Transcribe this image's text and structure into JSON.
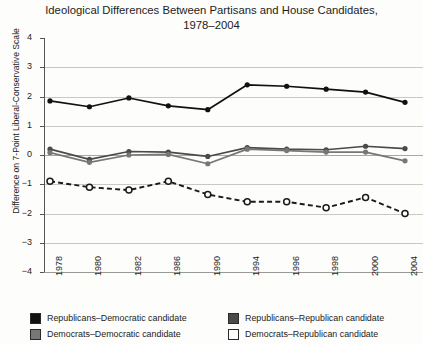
{
  "chart_data": {
    "type": "line",
    "title": "Ideological Differences Between Partisans and House Candidates, 1978–2004",
    "title_line1": "Ideological Differences Between Partisans and House Candidates,",
    "title_line2": "1978–2004",
    "xlabel": "",
    "ylabel": "Difference on 7-Point Liberal-Conservative Scale",
    "categories": [
      "1978",
      "1980",
      "1982",
      "1986",
      "1990",
      "1994",
      "1996",
      "1998",
      "2000",
      "2004"
    ],
    "ylim": [
      -4,
      4
    ],
    "yticks": [
      4,
      3,
      2,
      1,
      0,
      -1,
      -2,
      -3,
      -4
    ],
    "ytick_labels": [
      "4",
      "3",
      "2",
      "1",
      "0",
      "−1",
      "−2",
      "−3",
      "−4"
    ],
    "grid": true,
    "legend_position": "bottom",
    "series": [
      {
        "name": "Republicans–Democratic candidate",
        "color": "#111111",
        "marker": "filled-circle",
        "dash": "solid",
        "values": [
          1.85,
          1.65,
          1.95,
          1.68,
          1.55,
          2.4,
          2.35,
          2.25,
          2.15,
          1.8
        ]
      },
      {
        "name": "Republicans–Republican candidate",
        "color": "#4a4a4a",
        "marker": "filled-circle",
        "dash": "solid",
        "values": [
          0.2,
          -0.15,
          0.12,
          0.1,
          -0.05,
          0.25,
          0.2,
          0.18,
          0.3,
          0.22
        ]
      },
      {
        "name": "Democrats–Democratic candidate",
        "color": "#777777",
        "marker": "filled-circle",
        "dash": "solid",
        "values": [
          0.08,
          -0.25,
          0.0,
          0.02,
          -0.3,
          0.2,
          0.15,
          0.1,
          0.1,
          -0.2
        ]
      },
      {
        "name": "Democrats–Republican candidate",
        "color": "#1a1a1a",
        "marker": "open-circle",
        "dash": "dashed",
        "values": [
          -0.9,
          -1.1,
          -1.2,
          -0.9,
          -1.35,
          -1.6,
          -1.6,
          -1.8,
          -1.45,
          -2.0
        ]
      }
    ]
  },
  "legend": {
    "items": [
      {
        "label": "Republicans–Democratic candidate",
        "swatch": "#111111"
      },
      {
        "label": "Republicans–Republican candidate",
        "swatch": "#4a4a4a"
      },
      {
        "label": "Democrats–Democratic candidate",
        "swatch": "#777777"
      },
      {
        "label": "Democrats–Republican candidate",
        "swatch": "#ffffff"
      }
    ]
  }
}
